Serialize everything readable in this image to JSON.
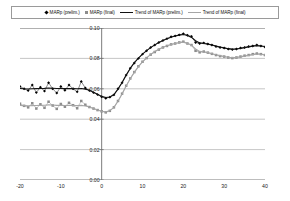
{
  "legend": {
    "items": [
      {
        "label": "MARp (prelim.)",
        "marker": "diamond-marker",
        "color": "#000000"
      },
      {
        "label": "MARp (final)",
        "marker": "square-marker",
        "color": "#8c8c8c"
      },
      {
        "label": "Trend of MARp (prelim.)",
        "marker": "line-dark",
        "color": "#111111"
      },
      {
        "label": "Trend of MARp (final)",
        "marker": "line-gray",
        "color": "#a6a6a6"
      }
    ]
  },
  "chart_data": {
    "type": "line",
    "title": "",
    "subtitle": "",
    "xlabel": "",
    "ylabel": "",
    "xlim": [
      -20,
      40
    ],
    "ylim": [
      0.0,
      0.1
    ],
    "grid": true,
    "legend_position": "top",
    "xticks": [
      "-20",
      "-10",
      "0",
      "10",
      "20",
      "30",
      "40"
    ],
    "xtick_values": [
      -20,
      -10,
      0,
      10,
      20,
      30,
      40
    ],
    "yticks": [
      "0.10",
      "0.08",
      "0.06",
      "0.04",
      "0.02",
      "0.00"
    ],
    "ytick_values": [
      0.1,
      0.08,
      0.06,
      0.04,
      0.02,
      0.0
    ],
    "x": [
      -20,
      -19,
      -18,
      -17,
      -16,
      -15,
      -14,
      -13,
      -12,
      -11,
      -10,
      -9,
      -8,
      -7,
      -6,
      -5,
      -4,
      -3,
      -2,
      -1,
      0,
      1,
      2,
      3,
      4,
      5,
      6,
      7,
      8,
      9,
      10,
      11,
      12,
      13,
      14,
      15,
      16,
      17,
      18,
      19,
      20,
      21,
      22,
      23,
      24,
      25,
      26,
      27,
      28,
      29,
      30,
      31,
      32,
      33,
      34,
      35,
      36,
      37,
      38,
      39,
      40
    ],
    "series": [
      {
        "name": "MARp (prelim.)",
        "style": "markers",
        "marker": "diamond-marker",
        "color": "#000000",
        "values": [
          0.0615,
          0.06,
          0.0588,
          0.0625,
          0.0575,
          0.061,
          0.0585,
          0.064,
          0.06,
          0.0572,
          0.0615,
          0.059,
          0.0625,
          0.06,
          0.058,
          0.0648,
          0.0605,
          0.0588,
          0.0575,
          0.0562,
          0.0548,
          0.0538,
          0.0545,
          0.056,
          0.06,
          0.064,
          0.069,
          0.0735,
          0.077,
          0.08,
          0.0828,
          0.085,
          0.0872,
          0.0888,
          0.0905,
          0.0918,
          0.093,
          0.0942,
          0.0948,
          0.0955,
          0.0962,
          0.0952,
          0.0945,
          0.0905,
          0.0898,
          0.0902,
          0.0895,
          0.0888,
          0.0878,
          0.0872,
          0.0868,
          0.0862,
          0.0858,
          0.0862,
          0.0868,
          0.0872,
          0.0878,
          0.0882,
          0.0888,
          0.0882,
          0.0875
        ]
      },
      {
        "name": "MARp (final)",
        "style": "markers",
        "marker": "square-marker",
        "color": "#8c8c8c",
        "values": [
          0.0502,
          0.0488,
          0.0478,
          0.0505,
          0.047,
          0.0498,
          0.0475,
          0.0515,
          0.049,
          0.0468,
          0.05,
          0.0482,
          0.0508,
          0.0492,
          0.0472,
          0.052,
          0.0495,
          0.048,
          0.047,
          0.046,
          0.0452,
          0.0445,
          0.0455,
          0.0478,
          0.052,
          0.0568,
          0.062,
          0.0668,
          0.071,
          0.0748,
          0.0778,
          0.0802,
          0.0825,
          0.0842,
          0.0858,
          0.0872,
          0.0882,
          0.0892,
          0.0898,
          0.0905,
          0.091,
          0.0898,
          0.0888,
          0.085,
          0.084,
          0.0845,
          0.0838,
          0.083,
          0.0822,
          0.0815,
          0.0812,
          0.0806,
          0.0802,
          0.0806,
          0.0812,
          0.0818,
          0.0822,
          0.0828,
          0.0832,
          0.0828,
          0.0822
        ]
      },
      {
        "name": "Trend of MARp (prelim.)",
        "style": "line",
        "color": "#111111",
        "values": [
          0.0602,
          0.06,
          0.0599,
          0.06,
          0.0601,
          0.0602,
          0.0603,
          0.0605,
          0.0604,
          0.0602,
          0.0602,
          0.0601,
          0.0602,
          0.0601,
          0.06,
          0.0602,
          0.0598,
          0.059,
          0.0578,
          0.0564,
          0.055,
          0.0543,
          0.0546,
          0.0562,
          0.0598,
          0.0642,
          0.069,
          0.0734,
          0.0772,
          0.0802,
          0.0828,
          0.0851,
          0.0871,
          0.0889,
          0.0904,
          0.0917,
          0.0929,
          0.0939,
          0.0947,
          0.0953,
          0.0957,
          0.0951,
          0.0938,
          0.0916,
          0.0902,
          0.0898,
          0.0894,
          0.0888,
          0.0881,
          0.0875,
          0.0869,
          0.0864,
          0.0861,
          0.0862,
          0.0866,
          0.0871,
          0.0876,
          0.0881,
          0.0884,
          0.0882,
          0.0878
        ]
      },
      {
        "name": "Trend of MARp (final)",
        "style": "line",
        "color": "#a6a6a6",
        "values": [
          0.049,
          0.0489,
          0.0488,
          0.0489,
          0.049,
          0.0491,
          0.0492,
          0.0494,
          0.0493,
          0.0491,
          0.0491,
          0.049,
          0.0491,
          0.049,
          0.0489,
          0.0491,
          0.0487,
          0.048,
          0.047,
          0.046,
          0.0452,
          0.0448,
          0.0456,
          0.0478,
          0.0518,
          0.0566,
          0.0618,
          0.0666,
          0.0708,
          0.0746,
          0.0777,
          0.0803,
          0.0826,
          0.0845,
          0.086,
          0.0873,
          0.0883,
          0.0891,
          0.0898,
          0.0904,
          0.0907,
          0.0899,
          0.0886,
          0.0862,
          0.0846,
          0.0842,
          0.0838,
          0.0831,
          0.0824,
          0.0818,
          0.0812,
          0.0808,
          0.0805,
          0.0806,
          0.081,
          0.0815,
          0.082,
          0.0825,
          0.0829,
          0.0827,
          0.0823
        ]
      }
    ]
  }
}
